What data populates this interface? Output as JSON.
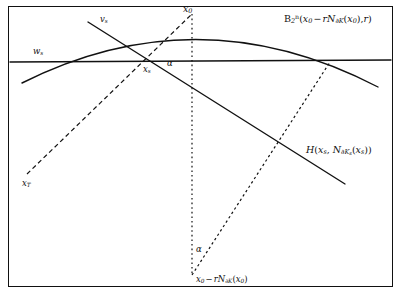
{
  "figure": {
    "type": "geometric-diagram",
    "width": 401,
    "height": 294,
    "background_color": "#ffffff",
    "stroke_color": "#111111",
    "border": {
      "present": true,
      "color": "#111111",
      "rect": [
        8,
        6,
        385,
        281
      ]
    },
    "labels": {
      "ball": {
        "text": "B2n(x0 - rN∂K(x0), r)",
        "parts": {
          "base": "B",
          "sub": "2",
          "sup": "n",
          "open": "(",
          "arg1_base": "x",
          "arg1_sub": "0",
          "minus": "−",
          "r1": "r",
          "normal_base": "N",
          "normal_sub": "∂K",
          "normal_open": "(",
          "normal_arg_base": "x",
          "normal_arg_sub": "0",
          "normal_close": ")",
          "comma": ",",
          "r2": "r",
          "close": ")"
        },
        "x": 284,
        "y": 15
      },
      "hyperplane": {
        "text": "H(xs, N∂Ks(xs))",
        "parts": {
          "base": "H",
          "open": "(",
          "arg1_base": "x",
          "arg1_sub": "s",
          "comma": ",",
          "normal_base": "N",
          "normal_sub_base": "∂K",
          "normal_sub_sub": "s",
          "normal_open": "(",
          "normal_arg_base": "x",
          "normal_arg_sub": "s",
          "normal_close": ")",
          "close": ")"
        },
        "x": 306,
        "y": 147
      },
      "x0": {
        "text": "x0",
        "base": "x",
        "sub": "0",
        "x": 183,
        "y": 5
      },
      "vs": {
        "text": "vs",
        "base": "v",
        "sub": "s",
        "x": 100,
        "y": 16
      },
      "ws": {
        "text": "ws",
        "base": "w",
        "sub": "s",
        "x": 33,
        "y": 48
      },
      "xs": {
        "text": "xs",
        "base": "x",
        "sub": "s",
        "x": 143,
        "y": 66
      },
      "alpha_top": {
        "text": "α",
        "x": 167,
        "y": 60
      },
      "alpha_bottom": {
        "text": "α",
        "x": 196,
        "y": 246
      },
      "xT": {
        "text": "xT",
        "base": "x",
        "sub": "T",
        "x": 22,
        "y": 180
      },
      "center": {
        "text": "x0 - rN∂K(x0)",
        "parts": {
          "base": "x",
          "sub": "0",
          "minus": "−",
          "r": "r",
          "normal_base": "N",
          "normal_sub": "∂K",
          "normal_open": "(",
          "normal_arg_base": "x",
          "normal_arg_sub": "0",
          "normal_close": ")"
        },
        "x": 196,
        "y": 276
      }
    },
    "geometry": {
      "arc_ball_boundary": {
        "style": "solid",
        "path": "M 22,83 Q 199,-4 378,87",
        "description": "boundary of ball B2n"
      },
      "horizontal_line_H": {
        "style": "solid",
        "x1": 10,
        "y1": 62,
        "x2": 391,
        "y2": 60,
        "description": "hyperplane H horizontal"
      },
      "tangent_line": {
        "style": "solid",
        "x1": 88,
        "y1": 22,
        "x2": 345,
        "y2": 184,
        "description": "line through vs, xs toward H(xs,...)"
      },
      "dashed_xT_to_x0": {
        "style": "dashed",
        "x1": 27,
        "y1": 174,
        "x2": 192,
        "y2": 14,
        "description": "dashed segment from xT through xs to x0"
      },
      "dotted_vertical": {
        "style": "dotted",
        "x1": 192,
        "y1": 14,
        "x2": 192,
        "y2": 275,
        "description": "vertical dotted axis from x0 to center"
      },
      "dotted_ray": {
        "style": "dotted",
        "x1": 192,
        "y1": 275,
        "x2": 330,
        "y2": 62,
        "description": "dotted ray from center to arc at right"
      }
    }
  }
}
